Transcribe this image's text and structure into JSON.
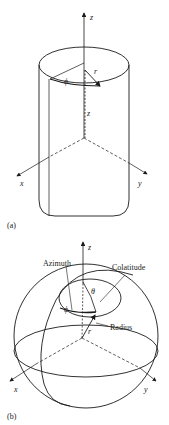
{
  "figure_a": {
    "panel_label": "(a)",
    "axes": {
      "z": "z",
      "x": "x",
      "y": "y"
    },
    "symbols": {
      "phi": "ϕ",
      "r": "r",
      "z": "z"
    }
  },
  "figure_b": {
    "panel_label": "(b)",
    "axes": {
      "z": "z",
      "x": "x",
      "y": "y"
    },
    "symbols": {
      "phi": "ϕ",
      "theta": "θ",
      "r": "r"
    },
    "annotations": {
      "azimuth": "Azimuth",
      "colatitude": "Colatitude",
      "radius": "Radius"
    }
  },
  "colors": {
    "stroke": "#1a1a1a",
    "background": "#ffffff"
  }
}
